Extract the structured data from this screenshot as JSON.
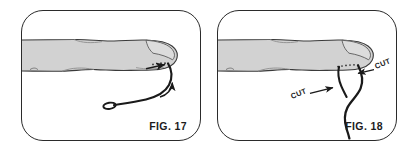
{
  "document": {
    "kind": "patent-figure-sheet",
    "background_color": "#ffffff"
  },
  "panels": [
    {
      "id": "fig17",
      "caption": "FIG. 17",
      "subject": "finger with suture thread loop at fingertip",
      "labels": [],
      "annotations": {
        "curved_arrow": "curved-arrow-icon",
        "straight_arrow": "left-arrow-icon"
      },
      "colors": {
        "skin_fill": "#d2d2d2",
        "outline": "#3a3a3a",
        "thread": "#1a1a1a",
        "border": "#2b2b2b"
      }
    },
    {
      "id": "fig18",
      "caption": "FIG. 18",
      "subject": "finger with suture thread cut at two points",
      "labels": [
        {
          "text": "CUT",
          "position": "left",
          "rotation": -22
        },
        {
          "text": "CUT",
          "position": "right",
          "rotation": -22
        }
      ],
      "annotations": {
        "left_arrow": "arrow-right-icon",
        "right_arrow": "arrow-left-icon"
      },
      "colors": {
        "skin_fill": "#d2d2d2",
        "outline": "#3a3a3a",
        "thread": "#1a1a1a",
        "border": "#2b2b2b"
      }
    }
  ]
}
